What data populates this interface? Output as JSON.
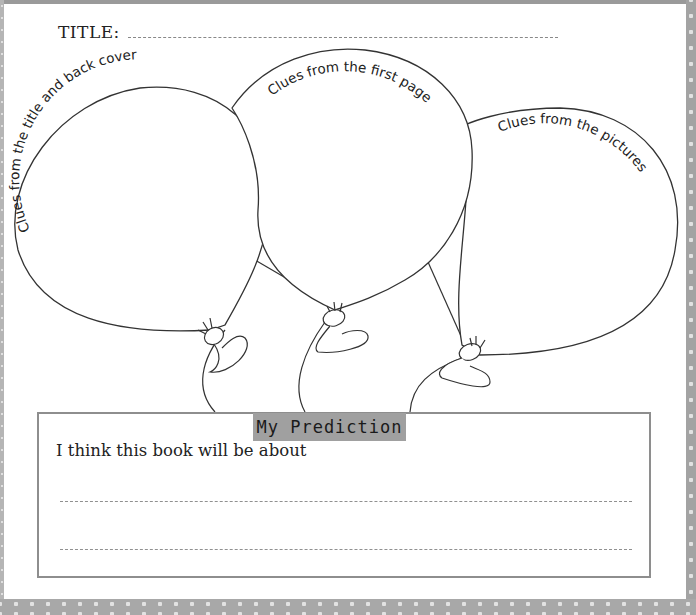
{
  "worksheet": {
    "title_label": "TITLE:",
    "balloons": [
      {
        "id": "left",
        "label": "Clues from the title and back cover"
      },
      {
        "id": "middle",
        "label": "Clues from the first page"
      },
      {
        "id": "right",
        "label": "Clues from the pictures"
      }
    ],
    "prediction": {
      "heading": "My Prediction",
      "prompt": "I think this book will be about",
      "answer_lines": 2
    }
  },
  "colors": {
    "frame": "#a3a3a3",
    "tab": "#a0a0a0",
    "outline": "#333333"
  }
}
